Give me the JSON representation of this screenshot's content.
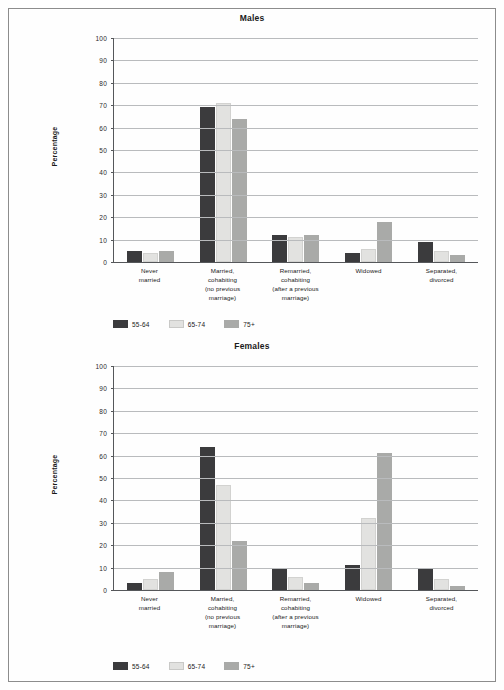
{
  "page": {
    "background": "#fefefe",
    "frame_color": "#8c8c8c"
  },
  "colors": {
    "series_55_64": "#3b3b3d",
    "series_65_74": "#e2e2e0",
    "series_75_plus": "#a9aaa8",
    "axis": "#55575a",
    "grid": "#b9bbbd"
  },
  "legend": {
    "items": [
      {
        "label": "55-64",
        "color": "#3b3b3d"
      },
      {
        "label": "65-74",
        "color": "#e2e2e0"
      },
      {
        "label": "75+",
        "color": "#a9aaa8"
      }
    ]
  },
  "axis": {
    "ylabel": "Percentage",
    "yticks": [
      "100",
      "90",
      "80",
      "70",
      "60",
      "50",
      "40",
      "30",
      "20",
      "10",
      "0"
    ]
  },
  "categories": [
    "Never\nmarried",
    "Married,\ncohabiting\n(no previous\nmarriage)",
    "Remarried,\ncohabiting\n(after a previous\nmarriage)",
    "Widowed",
    "Separated,\ndivorced"
  ],
  "chart_data": [
    {
      "type": "bar",
      "title": "Males",
      "xlabel": "",
      "ylabel": "Percentage",
      "ylim": [
        0,
        100
      ],
      "ytick_step": 10,
      "grid": true,
      "legend_position": "bottom-left",
      "categories": [
        "Never married",
        "Married, cohabiting (no previous marriage)",
        "Remarried, cohabiting (after a previous marriage)",
        "Widowed",
        "Separated, divorced"
      ],
      "series": [
        {
          "name": "55-64",
          "color": "#3b3b3d",
          "values": [
            5,
            69,
            12,
            4,
            9
          ]
        },
        {
          "name": "65-74",
          "color": "#e2e2e0",
          "values": [
            4,
            71,
            11,
            6,
            5
          ]
        },
        {
          "name": "75+",
          "color": "#a9aaa8",
          "values": [
            5,
            64,
            12,
            18,
            3
          ]
        }
      ]
    },
    {
      "type": "bar",
      "title": "Females",
      "xlabel": "",
      "ylabel": "Percentage",
      "ylim": [
        0,
        100
      ],
      "ytick_step": 10,
      "grid": true,
      "legend_position": "bottom-left",
      "categories": [
        "Never married",
        "Married, cohabiting (no previous marriage)",
        "Remarried, cohabiting (after a previous marriage)",
        "Widowed",
        "Separated, divorced"
      ],
      "series": [
        {
          "name": "55-64",
          "color": "#3b3b3d",
          "values": [
            3,
            64,
            10,
            11,
            10
          ]
        },
        {
          "name": "65-74",
          "color": "#e2e2e0",
          "values": [
            5,
            47,
            6,
            32,
            5
          ]
        },
        {
          "name": "75+",
          "color": "#a9aaa8",
          "values": [
            8,
            22,
            3,
            61,
            2
          ]
        }
      ]
    }
  ]
}
